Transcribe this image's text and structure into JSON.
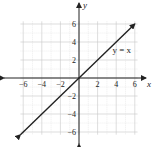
{
  "chart_data": {
    "type": "line",
    "title": "",
    "xlabel": "x",
    "ylabel": "y",
    "xlim": [
      -6.5,
      6.5
    ],
    "ylim": [
      -6.5,
      6.5
    ],
    "grid": true,
    "xticks": [
      -6,
      -4,
      -2,
      2,
      4,
      6
    ],
    "yticks": [
      -6,
      -4,
      -2,
      2,
      4,
      6
    ],
    "series": [
      {
        "name": "y = x",
        "x": [
          -6.3,
          6.0
        ],
        "y": [
          -6.3,
          6.0
        ],
        "arrows": "both"
      }
    ],
    "annotations": [
      {
        "text": "y = x",
        "x": 4.6,
        "y": 2.8
      }
    ]
  },
  "labels": {
    "x_axis": "x",
    "y_axis": "y",
    "equation": "y = x"
  }
}
